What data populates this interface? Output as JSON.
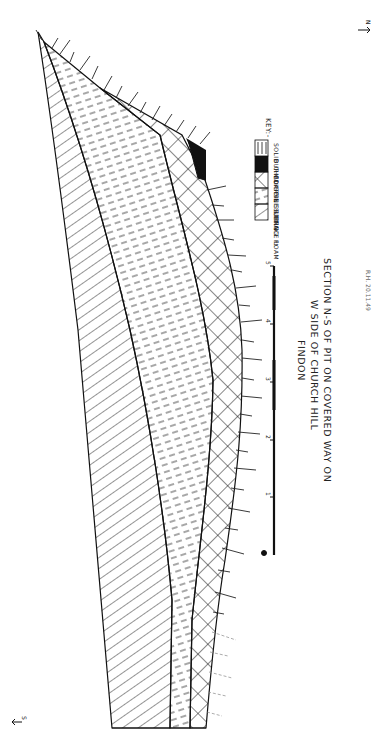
{
  "figure": {
    "title_lines": [
      "SECTION N-S OF PIT ON COVERED WAY ON",
      "W SIDE OF CHURCH HILL",
      "FINDON"
    ],
    "orientation": {
      "north_label": "N",
      "south_label": "S"
    },
    "signature": "R.H. 20.11.49"
  },
  "key": {
    "heading": "KEY:-",
    "items": [
      {
        "label": "SURFACE LOAM",
        "pattern": "diagonal-hatch"
      },
      {
        "label": "FINE SILTING",
        "pattern": "dashed-lines"
      },
      {
        "label": "COARSE SILTING",
        "pattern": "cross-hatch"
      },
      {
        "label": "BURIED SOIL",
        "pattern": "solid-black"
      },
      {
        "label": "SOLID CHALK",
        "pattern": "vertical-ticks"
      }
    ]
  },
  "scale": {
    "unit": "Ft.",
    "ticks": [
      "1",
      "2",
      "3",
      "4",
      "5"
    ],
    "max": 5
  },
  "colors": {
    "ink": "#111111",
    "paper": "#ffffff"
  }
}
